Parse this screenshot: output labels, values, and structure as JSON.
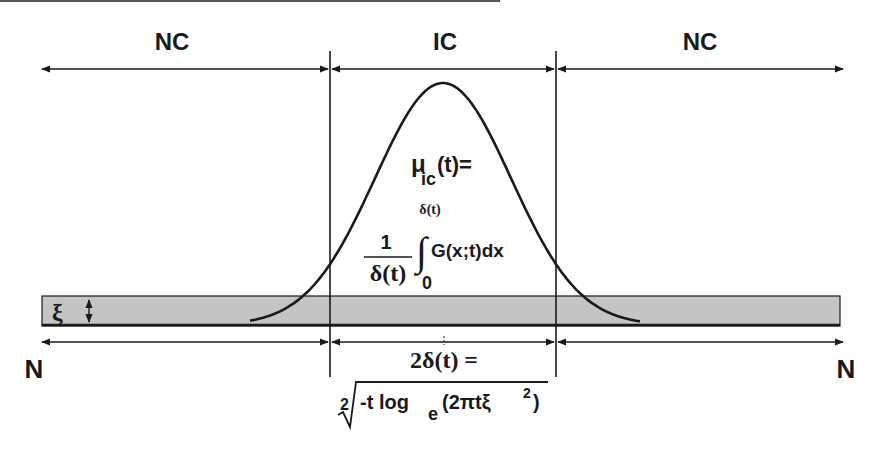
{
  "diagram": {
    "top_regions": {
      "left_label": "NC",
      "center_label": "IC",
      "right_label": "NC"
    },
    "bottom_labels": {
      "left": "N",
      "right": "N"
    },
    "band": {
      "symbol": "ξ",
      "fill_color": "#c4c4c4"
    },
    "curve": {
      "type": "gaussian",
      "stroke_color": "#1a1a1a"
    },
    "formula_mu": {
      "lhs_main": "μ",
      "lhs_sub": "ic",
      "lhs_rest": "(t)=",
      "fraction_numerator": "1",
      "fraction_denominator": "δ(t)",
      "integral_upper": "δ(t)",
      "integral_lower": "0",
      "integral_symbol": "∫",
      "integrand": "G(x;t)dx"
    },
    "formula_delta": {
      "lhs": "2δ(t) =",
      "root_index": "2",
      "radicand_pre": "-t log",
      "radicand_sub": "e",
      "radicand_post": "(2πtξ",
      "radicand_sup": "2",
      "radicand_close": ")"
    },
    "colors": {
      "line": "#1a1a1a",
      "band": "#c4c4c4",
      "background": "#ffffff"
    }
  }
}
